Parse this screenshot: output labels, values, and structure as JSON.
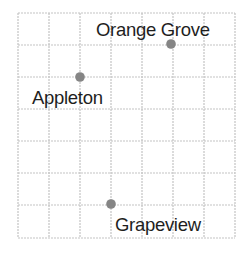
{
  "map": {
    "grid": {
      "columns": 7,
      "rows": 7,
      "x_lines": [
        18,
        49,
        80,
        111,
        142,
        173,
        204,
        235
      ],
      "y_lines": [
        13,
        45,
        77,
        109,
        141,
        173,
        205,
        238
      ],
      "line_color": "#c4c4c4"
    },
    "dot_color": "#858585",
    "places": [
      {
        "name": "Orange Grove",
        "x": 171,
        "y": 44,
        "label_x": 96,
        "label_y": 36
      },
      {
        "name": "Appleton",
        "x": 80,
        "y": 77,
        "label_x": 32,
        "label_y": 104
      },
      {
        "name": "Grapeview",
        "x": 111,
        "y": 204,
        "label_x": 115,
        "label_y": 231
      }
    ]
  }
}
